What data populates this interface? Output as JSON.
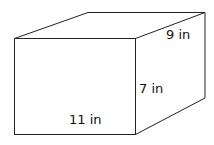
{
  "diagram": {
    "shape": "rectangular prism",
    "labels": {
      "depth": "9 in",
      "height": "7 in",
      "length": "11 in"
    },
    "stroke_color": "#222222"
  }
}
